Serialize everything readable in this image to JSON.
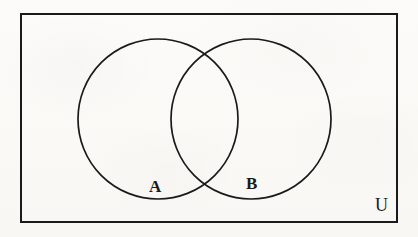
{
  "figure": {
    "type": "venn-diagram",
    "background_color": "#fbfaf8",
    "stroke_color": "#1a1a1a"
  },
  "universe": {
    "label": "U",
    "shape": "rectangle",
    "x": 21,
    "y": 14,
    "width": 376,
    "height": 208,
    "stroke_width": 2,
    "label_position": {
      "x": 382,
      "y": 205
    }
  },
  "sets": [
    {
      "label": "A",
      "shape": "circle",
      "cx": 158,
      "cy": 119,
      "r": 80,
      "stroke_width": 1.7,
      "fill": "none",
      "label_position": {
        "x": 155,
        "y": 187
      }
    },
    {
      "label": "B",
      "shape": "circle",
      "cx": 251,
      "cy": 119,
      "r": 80,
      "stroke_width": 1.7,
      "fill": "none",
      "label_position": {
        "x": 253,
        "y": 184
      }
    }
  ],
  "intersections": [
    {
      "name": "upper-crossing",
      "x": 204,
      "y": 62
    },
    {
      "name": "lower-crossing",
      "x": 204,
      "y": 178
    }
  ]
}
